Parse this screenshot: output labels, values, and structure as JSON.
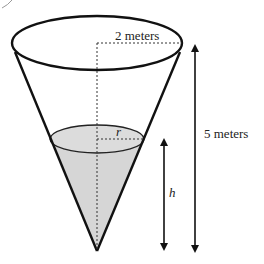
{
  "diagram": {
    "type": "conical-tank",
    "labels": {
      "top_radius": "2 meters",
      "total_height": "5 meters",
      "water_radius": "r",
      "water_height": "h"
    },
    "colors": {
      "outline": "#111111",
      "water_fill": "#d6d6d6",
      "dotted": "#333333",
      "background": "#ffffff"
    }
  }
}
